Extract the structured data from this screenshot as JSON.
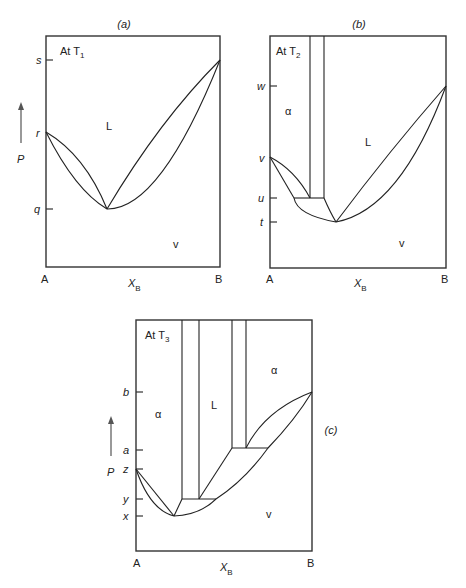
{
  "figure": {
    "panels": [
      {
        "id": "a",
        "caption": "(a)",
        "temperature_label": "At T",
        "temperature_sub": "1",
        "axis": {
          "x_label": "X",
          "x_sub": "B",
          "y_label": "P",
          "left_end": "A",
          "right_end": "B"
        },
        "pressure_ticks": [
          "s",
          "r",
          "q"
        ],
        "regions": {
          "liquid": "L",
          "vapor": "v"
        }
      },
      {
        "id": "b",
        "caption": "(b)",
        "temperature_label": "At T",
        "temperature_sub": "2",
        "axis": {
          "x_label": "X",
          "x_sub": "B",
          "left_end": "A",
          "right_end": "B"
        },
        "pressure_ticks": [
          "w",
          "v",
          "u",
          "t"
        ],
        "regions": {
          "solid": "α",
          "liquid": "L",
          "vapor": "v"
        }
      },
      {
        "id": "c",
        "caption": "(c)",
        "temperature_label": "At T",
        "temperature_sub": "3",
        "axis": {
          "x_label": "X",
          "x_sub": "B",
          "y_label": "P",
          "left_end": "A",
          "right_end": "B"
        },
        "pressure_ticks": [
          "b",
          "a",
          "z",
          "y",
          "x"
        ],
        "regions": {
          "solid_left": "α",
          "liquid": "L",
          "solid_right": "α",
          "vapor": "v"
        }
      }
    ]
  }
}
